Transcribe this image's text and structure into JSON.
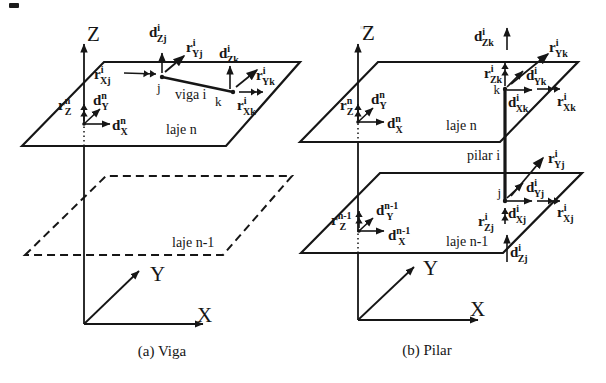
{
  "figure": {
    "background": "#ffffff",
    "ink": "#161616",
    "captions": {
      "a": "(a) Viga",
      "b": "(b) Pilar"
    }
  },
  "diagram_a": {
    "axes": {
      "x": "X",
      "y": "Y",
      "z": "Z"
    },
    "labels": {
      "upper_plane": "laje n",
      "lower_plane": "laje n-1",
      "member": "viga i",
      "node_j": "j",
      "node_k": "k"
    },
    "vectors": {
      "rXj": {
        "base": "r",
        "sup": "i",
        "sub": "Xj",
        "dx": -3.5
      },
      "dZj": {
        "base": "d",
        "sup": "i",
        "sub": "Zj",
        "dx": -3.5
      },
      "rYj": {
        "base": "r",
        "sup": "i",
        "sub": "Yj",
        "dx": -3.5
      },
      "dZk": {
        "base": "d",
        "sup": "i",
        "sub": "Zk",
        "dx": -3.5
      },
      "rYk": {
        "base": "r",
        "sup": "i",
        "sub": "Yk",
        "dx": -3.5
      },
      "rXk": {
        "base": "r",
        "sup": "i",
        "sub": "Xk",
        "dx": -3.5
      },
      "rZ_n": {
        "base": "r",
        "sup": "n",
        "sub": "Z",
        "dx": -5.5
      },
      "dY_n": {
        "base": "d",
        "sup": "n",
        "sub": "Y",
        "dx": -5.5
      },
      "dX_n": {
        "base": "d",
        "sup": "n",
        "sub": "X",
        "dx": -5.5
      }
    }
  },
  "diagram_b": {
    "axes": {
      "x": "X",
      "y": "Y",
      "z": "Z"
    },
    "labels": {
      "upper_plane": "laje n",
      "lower_plane": "laje n-1",
      "member": "pilar i",
      "node_j": "j",
      "node_k": "k"
    },
    "vectors": {
      "dZk": {
        "base": "d",
        "sup": "i",
        "sub": "Zk",
        "dx": -3.5
      },
      "rZk": {
        "base": "r",
        "sup": "i",
        "sub": "Zk",
        "dx": -3.5
      },
      "dYk": {
        "base": "d",
        "sup": "i",
        "sub": "Yk",
        "dx": -3.5
      },
      "rYk": {
        "base": "r",
        "sup": "i",
        "sub": "Yk",
        "dx": -3.5
      },
      "dXk": {
        "base": "d",
        "sup": "i",
        "sub": "Xk",
        "dx": -3.5
      },
      "rXk": {
        "base": "r",
        "sup": "i",
        "sub": "Xk",
        "dx": -3.5
      },
      "rZ_n": {
        "base": "r",
        "sup": "n",
        "sub": "Z",
        "dx": -5.5
      },
      "dY_n": {
        "base": "d",
        "sup": "n",
        "sub": "Y",
        "dx": -5.5
      },
      "dX_n": {
        "base": "d",
        "sup": "n",
        "sub": "X",
        "dx": -5.5
      },
      "rYj": {
        "base": "r",
        "sup": "i",
        "sub": "Yj",
        "dx": -3.5
      },
      "dYj": {
        "base": "d",
        "sup": "i",
        "sub": "Yj",
        "dx": -3.5
      },
      "dXj": {
        "base": "d",
        "sup": "i",
        "sub": "Xj",
        "dx": -3.5
      },
      "rXj": {
        "base": "r",
        "sup": "i",
        "sub": "Xj",
        "dx": -3.5
      },
      "rZj": {
        "base": "r",
        "sup": "i",
        "sub": "Zj",
        "dx": -3.5
      },
      "dZj": {
        "base": "d",
        "sup": "i",
        "sub": "Zj",
        "dx": -3.5
      },
      "rZ_n1": {
        "base": "r",
        "sup": "n-1",
        "sub": "Z",
        "dx": -12
      },
      "dY_n1": {
        "base": "d",
        "sup": "n-1",
        "sub": "Y",
        "dx": -12
      },
      "dX_n1": {
        "base": "d",
        "sup": "n-1",
        "sub": "X",
        "dx": -12
      }
    }
  }
}
